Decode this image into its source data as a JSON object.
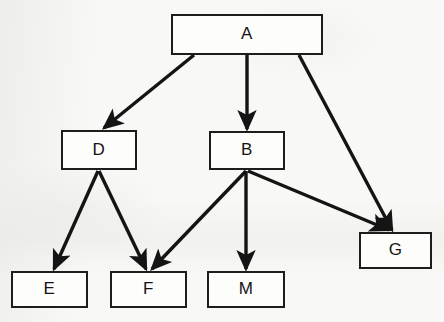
{
  "diagram": {
    "type": "node-link-diagram",
    "canvas": {
      "width": 444,
      "height": 322
    },
    "style": {
      "background_color": "#f8f8f6",
      "node_fill": "#fdfdfc",
      "node_border_color": "#1d1d1d",
      "edge_color": "#141414",
      "label_color": "#141414"
    },
    "nodes": [
      {
        "id": "A",
        "label": "A",
        "x": 171,
        "y": 14,
        "width": 152,
        "height": 41
      },
      {
        "id": "D",
        "label": "D",
        "x": 61,
        "y": 130,
        "width": 76,
        "height": 40
      },
      {
        "id": "B",
        "label": "B",
        "x": 209,
        "y": 131,
        "width": 76,
        "height": 39
      },
      {
        "id": "G",
        "label": "G",
        "x": 359,
        "y": 232,
        "width": 73,
        "height": 37
      },
      {
        "id": "E",
        "label": "E",
        "x": 11,
        "y": 271,
        "width": 77,
        "height": 37
      },
      {
        "id": "F",
        "label": "F",
        "x": 110,
        "y": 271,
        "width": 77,
        "height": 37
      },
      {
        "id": "M",
        "label": "M",
        "x": 207,
        "y": 271,
        "width": 78,
        "height": 37
      }
    ],
    "edges": [
      {
        "id": "A-D",
        "from": "A",
        "to": "D",
        "x1": 194,
        "y1": 55,
        "x2": 104,
        "y2": 128
      },
      {
        "id": "A-B",
        "from": "A",
        "to": "B",
        "x1": 247,
        "y1": 55,
        "x2": 247,
        "y2": 129
      },
      {
        "id": "A-G",
        "from": "A",
        "to": "G",
        "x1": 299,
        "y1": 55,
        "x2": 392,
        "y2": 230
      },
      {
        "id": "D-E",
        "from": "D",
        "to": "E",
        "x1": 98,
        "y1": 171,
        "x2": 54,
        "y2": 269
      },
      {
        "id": "D-F",
        "from": "D",
        "to": "F",
        "x1": 99,
        "y1": 171,
        "x2": 146,
        "y2": 269
      },
      {
        "id": "B-F",
        "from": "B",
        "to": "F",
        "x1": 246,
        "y1": 171,
        "x2": 152,
        "y2": 269
      },
      {
        "id": "B-M",
        "from": "B",
        "to": "M",
        "x1": 246,
        "y1": 171,
        "x2": 246,
        "y2": 269
      },
      {
        "id": "B-G",
        "from": "B",
        "to": "G",
        "x1": 248,
        "y1": 171,
        "x2": 389,
        "y2": 230
      }
    ]
  }
}
